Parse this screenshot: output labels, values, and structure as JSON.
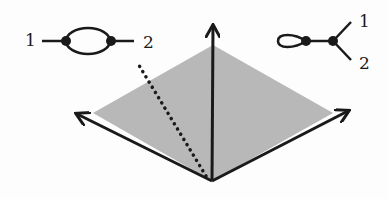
{
  "diagram": {
    "type": "cone-with-graph-insets",
    "colors": {
      "ink": "#1a1a1a",
      "shade": "#b8b8b8",
      "background": "#fdfdfd"
    },
    "cone_region": {
      "points": [
        [
          213,
          45
        ],
        [
          333,
          113
        ],
        [
          212,
          181
        ],
        [
          93,
          113
        ]
      ]
    },
    "axes": [
      {
        "name": "up",
        "from": [
          212,
          181
        ],
        "to": [
          213,
          24
        ]
      },
      {
        "name": "left",
        "from": [
          212,
          181
        ],
        "to": [
          75,
          113
        ]
      },
      {
        "name": "right",
        "from": [
          212,
          181
        ],
        "to": [
          350,
          110
        ]
      }
    ],
    "dotted_ray": {
      "from": [
        206,
        176
      ],
      "to": [
        137,
        62
      ]
    },
    "inset_left": {
      "label_left": "1",
      "label_right": "2",
      "description": "bubble graph: two vertices joined by two edges, each with one external leg"
    },
    "inset_right": {
      "label_top": "1",
      "label_bottom": "2",
      "description": "tadpole graph: self-loop vertex connected to a trivalent vertex with two external legs"
    }
  }
}
